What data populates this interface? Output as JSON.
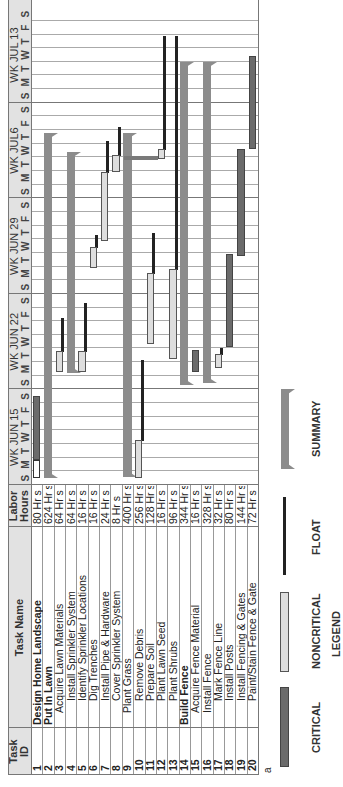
{
  "chart_data": {
    "type": "table",
    "subtype": "gantt",
    "orientation": "rotated-90-ccw",
    "columns": [
      "Task ID",
      "Task Name",
      "Labor Hours"
    ],
    "timeline": {
      "weeks": [
        "WK JUN 15",
        "WK JUN 22",
        "WK JUN 29",
        "WK JUL6",
        "WK JUL 13"
      ],
      "days": [
        "S",
        "M",
        "T",
        "W",
        "T",
        "F",
        "S"
      ]
    },
    "tasks": [
      {
        "id": "1",
        "name": "Design Home Landscape",
        "hours": "80 Hr s",
        "level": 0,
        "bold": true,
        "type": "critical",
        "start": 1.8,
        "end": 6.5,
        "pre_start": 0.5
      },
      {
        "id": "2",
        "name": "Put In Lawn",
        "hours": "624 Hr s",
        "level": 0,
        "bold": true,
        "type": "summary",
        "start": 0.5,
        "end": 25.8
      },
      {
        "id": "3",
        "name": "Acquire Lawn Materials",
        "hours": "64 Hr s",
        "level": 1,
        "type": "noncritical",
        "start": 8.3,
        "end": 9.8,
        "float_end": 12.3
      },
      {
        "id": "4",
        "name": "Install Sprinkler System",
        "hours": "64 Hr s",
        "level": 2,
        "type": "summary",
        "start": 8.2,
        "end": 24.4
      },
      {
        "id": "5",
        "name": "Identify Sprinkler Locations",
        "hours": "16 Hr s",
        "level": 2,
        "type": "noncritical",
        "start": 8.3,
        "end": 9.8,
        "float_end": 13.4
      },
      {
        "id": "6",
        "name": "Dig Trenches",
        "hours": "16 Hr s",
        "level": 2,
        "type": "noncritical",
        "start": 15.9,
        "end": 17.4,
        "float_end": 18.4
      },
      {
        "id": "7",
        "name": "Install Pipe & Hardware",
        "hours": "24 Hr s",
        "level": 2,
        "type": "noncritical",
        "start": 17.9,
        "end": 22.9,
        "float_end": 25.3
      },
      {
        "id": "8",
        "name": "Cover Sprinkler System",
        "hours": "8 Hr s",
        "level": 2,
        "type": "noncritical",
        "start": 22.9,
        "end": 24.2,
        "float_end": 26.3
      },
      {
        "id": "9",
        "name": "Plant Grass",
        "hours": "400 Hr s",
        "level": 1,
        "type": "summary",
        "start": 0.6,
        "end": 25.8
      },
      {
        "id": "10",
        "name": "Remove Debris",
        "hours": "256 Hr s",
        "level": 2,
        "type": "noncritical",
        "start": 0.5,
        "end": 3.3,
        "float_end": 9.2
      },
      {
        "id": "11",
        "name": "Prepare Soil",
        "hours": "128 Hr s",
        "level": 2,
        "type": "noncritical",
        "start": 10.3,
        "end": 15.5,
        "float_end": 18.5
      },
      {
        "id": "12",
        "name": "Plant Lawn Seed",
        "hours": "16 Hr s",
        "level": 2,
        "type": "noncritical",
        "start": 23.9,
        "end": 24.6,
        "float_end": 33.0
      },
      {
        "id": "13",
        "name": "Plant Shrubs",
        "hours": "96 Hr s",
        "level": 2,
        "type": "noncritical",
        "start": 9.2,
        "end": 15.8,
        "float_end": 33.0
      },
      {
        "id": "14",
        "name": "Build Fence",
        "hours": "344 Hr s",
        "level": 0,
        "bold": true,
        "type": "summary",
        "start": 7.3,
        "end": 31.0
      },
      {
        "id": "15",
        "name": "Acquire Fence Material",
        "hours": "16 Hr s",
        "level": 1,
        "type": "critical",
        "start": 8.3,
        "end": 9.9
      },
      {
        "id": "16",
        "name": "Install Fence",
        "hours": "328 Hr s",
        "level": 1,
        "type": "summary",
        "start": 7.5,
        "end": 31.0
      },
      {
        "id": "17",
        "name": "Mark Fence Line",
        "hours": "32 Hr s",
        "level": 2,
        "type": "noncritical",
        "start": 8.6,
        "end": 9.6,
        "float_end": 10.1
      },
      {
        "id": "18",
        "name": "Install Posts",
        "hours": "80 Hr s",
        "level": 2,
        "type": "critical",
        "start": 10.1,
        "end": 16.9
      },
      {
        "id": "19",
        "name": "Install Fencing & Gates",
        "hours": "144 Hr s",
        "level": 2,
        "type": "critical",
        "start": 16.8,
        "end": 24.6
      },
      {
        "id": "20",
        "name": "Paint/Stain Fence & Gate",
        "hours": "72 Hr s",
        "level": 2,
        "type": "critical",
        "start": 24.6,
        "end": 31.4
      }
    ],
    "legend": [
      "CRITICAL",
      "NONCRITICAL",
      "FLOAT",
      "SUMMARY"
    ],
    "legend_title": "LEGEND"
  },
  "header": {
    "task_id": "Task ID",
    "task_id_l1": "Task",
    "task_id_l2": "ID",
    "task_name": "Task Name",
    "labor_l1": "Labor",
    "labor_l2": "Hours"
  },
  "footnote": "a",
  "legend": {
    "title": "LEGEND",
    "critical": "CRITICAL",
    "noncritical": "NONCRITICAL",
    "float": "FLOAT",
    "summary": "SUMMARY"
  },
  "colors": {
    "critical": "#6b6b6b",
    "noncritical": "#dedede",
    "float": "#222222",
    "summary": "#8c8c8c",
    "header_bg": "#e2e2e2"
  }
}
